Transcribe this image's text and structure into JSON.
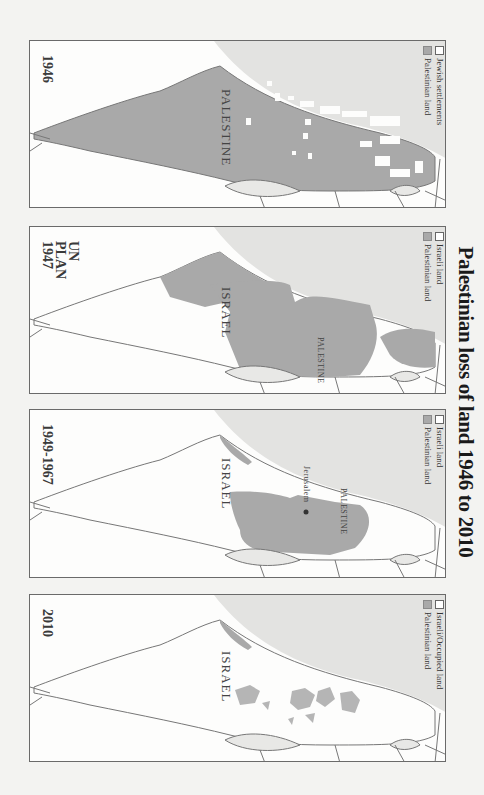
{
  "title": "Palestinian loss of land 1946 to 2010",
  "colors": {
    "palestinian_land": "#a9a9a9",
    "israeli_land": "#ffffff",
    "sea": "#e3e3e1",
    "border": "#777777",
    "background": "#f3f3f1"
  },
  "panels": [
    {
      "year_label": "1946",
      "legend": [
        {
          "swatch": "white",
          "label": "Jewish settlements"
        },
        {
          "swatch": "gray",
          "label": "Palestinian land"
        }
      ],
      "country_labels": [
        "PALESTINE"
      ]
    },
    {
      "year_label": "UN PLAN 1947",
      "year_lines": [
        "UN",
        "PLAN",
        "1947"
      ],
      "legend": [
        {
          "swatch": "white",
          "label": "Israeli land"
        },
        {
          "swatch": "gray",
          "label": "Palestinian land"
        }
      ],
      "country_labels": [
        "ISRAEL",
        "PALESTINE"
      ]
    },
    {
      "year_label": "1949-1967",
      "legend": [
        {
          "swatch": "white",
          "label": "Israeli land"
        },
        {
          "swatch": "gray",
          "label": "Palestinian land"
        }
      ],
      "country_labels": [
        "ISRAEL",
        "PALESTINE"
      ],
      "city_label": "Jerusalem"
    },
    {
      "year_label": "2010",
      "legend": [
        {
          "swatch": "white",
          "label": "Israeli/Occupied land"
        },
        {
          "swatch": "gray",
          "label": "Palestinian land"
        }
      ],
      "country_labels": [
        "ISRAEL"
      ]
    }
  ]
}
